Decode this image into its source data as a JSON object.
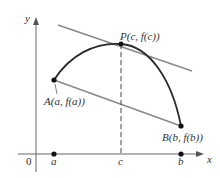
{
  "diagram": {
    "axes": {
      "x_label": "x",
      "y_label": "y",
      "origin_label": "0"
    },
    "ticks": {
      "a": "a",
      "c": "c",
      "b": "b"
    },
    "points": {
      "A": {
        "label": "A(a, f(a))"
      },
      "P": {
        "label": "P(c, f(c))"
      },
      "B": {
        "label": "B(b, f(b))"
      }
    },
    "colors": {
      "curve": "#2b2b2b",
      "tangent_line": "#8a8a8a",
      "secant_line": "#8a8a8a",
      "axes": "#555555",
      "dashed": "#444444"
    }
  }
}
